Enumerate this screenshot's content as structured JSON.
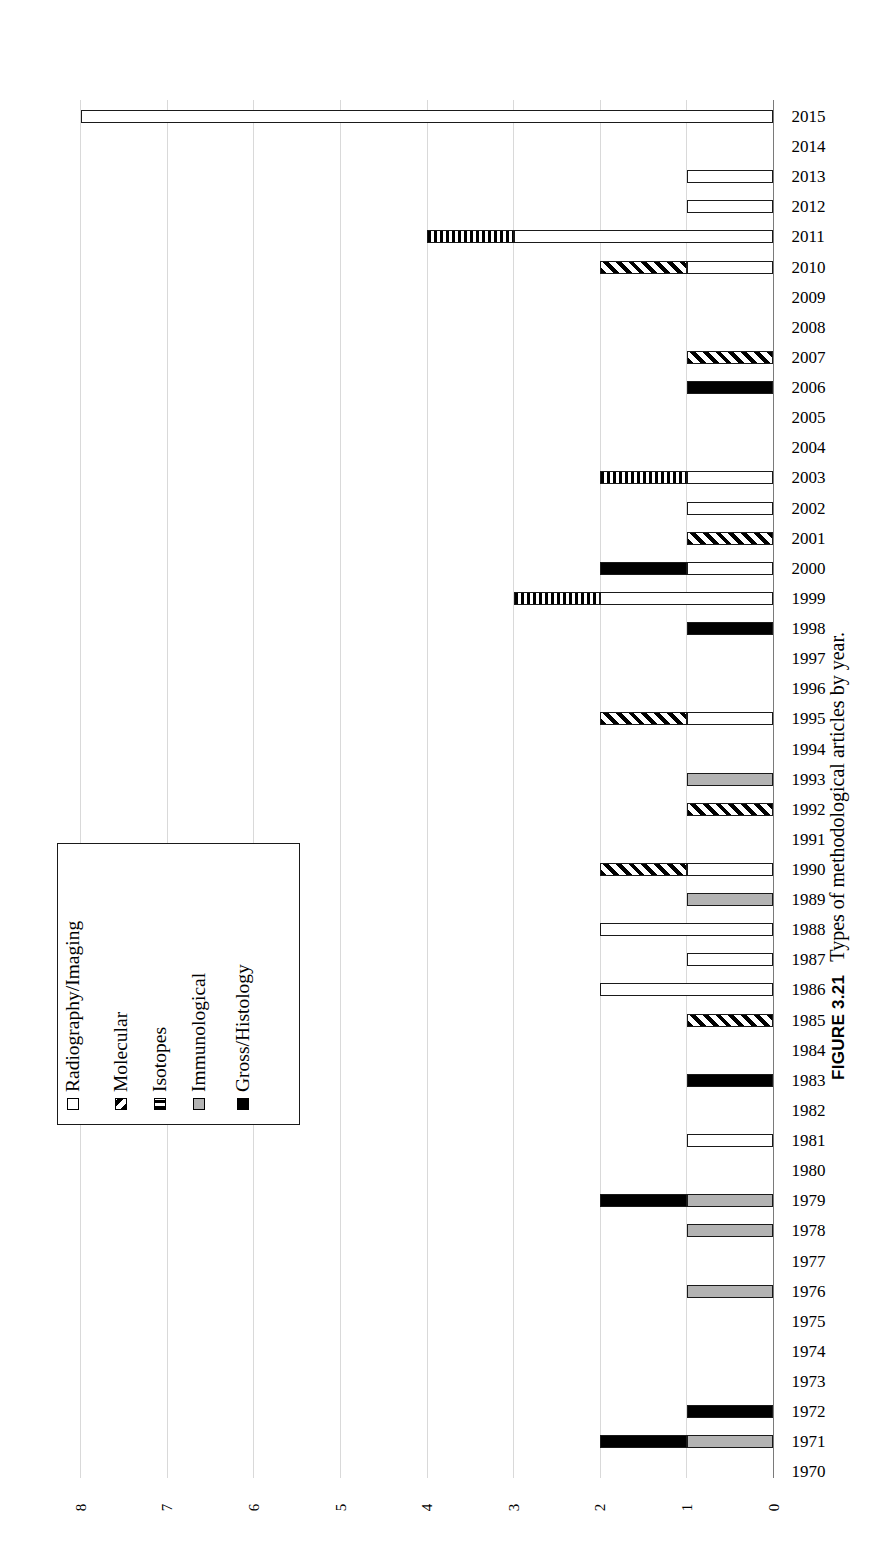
{
  "figure": {
    "number": "FIGURE 3.21",
    "caption": "Types of methodological articles by year."
  },
  "legend": {
    "items": [
      {
        "label": "Radiography/Imaging",
        "key": "radiography",
        "color": "#ffffff",
        "pattern": "solid-white"
      },
      {
        "label": "Molecular",
        "key": "molecular",
        "color": "#000000",
        "pattern": "diagonal-hatch"
      },
      {
        "label": "Isotopes",
        "key": "isotopes",
        "color": "#000000",
        "pattern": "vertical-stripes"
      },
      {
        "label": "Immunological",
        "key": "immuno",
        "color": "#b3b3b3",
        "pattern": "solid-gray"
      },
      {
        "label": "Gross/Histology",
        "key": "gross",
        "color": "#000000",
        "pattern": "solid-black"
      }
    ]
  },
  "axes": {
    "value_ticks": [
      "8",
      "7",
      "6",
      "5",
      "4",
      "3",
      "2",
      "1",
      "0"
    ],
    "value_max": 8,
    "value_min": 0,
    "grid": true,
    "orientation": "horizontal-bars-rotated"
  },
  "chart_data": {
    "type": "bar",
    "title": "Types of methodological articles by year.",
    "xlabel": "",
    "ylabel": "",
    "ylim": [
      0,
      8
    ],
    "stacked": true,
    "grid": true,
    "legend_position": "inside-left",
    "categories": [
      "2015",
      "2014",
      "2013",
      "2012",
      "2011",
      "2010",
      "2009",
      "2008",
      "2007",
      "2006",
      "2005",
      "2004",
      "2003",
      "2002",
      "2001",
      "2000",
      "1999",
      "1998",
      "1997",
      "1996",
      "1995",
      "1994",
      "1993",
      "1992",
      "1991",
      "1990",
      "1989",
      "1988",
      "1987",
      "1986",
      "1985",
      "1984",
      "1983",
      "1982",
      "1981",
      "1980",
      "1979",
      "1978",
      "1977",
      "1976",
      "1975",
      "1974",
      "1973",
      "1972",
      "1971",
      "1970"
    ],
    "series": [
      {
        "name": "Radiography/Imaging",
        "key": "radiography",
        "values": [
          8,
          0,
          1,
          1,
          3,
          1,
          0,
          0,
          0,
          0,
          0,
          0,
          1,
          1,
          0,
          1,
          2,
          0,
          0,
          0,
          1,
          0,
          0,
          0,
          0,
          1,
          0,
          2,
          1,
          2,
          0,
          0,
          0,
          0,
          1,
          0,
          0,
          0,
          0,
          0,
          0,
          0,
          0,
          0,
          0,
          0
        ]
      },
      {
        "name": "Molecular",
        "key": "molecular",
        "values": [
          0,
          0,
          0,
          0,
          0,
          1,
          0,
          0,
          1,
          0,
          0,
          0,
          0,
          0,
          1,
          0,
          0,
          0,
          0,
          0,
          1,
          0,
          0,
          1,
          0,
          1,
          0,
          0,
          0,
          0,
          1,
          0,
          0,
          0,
          0,
          0,
          0,
          0,
          0,
          0,
          0,
          0,
          0,
          0,
          0,
          0
        ]
      },
      {
        "name": "Isotopes",
        "key": "isotopes",
        "values": [
          0,
          0,
          0,
          0,
          1,
          0,
          0,
          0,
          0,
          0,
          0,
          0,
          1,
          0,
          0,
          0,
          1,
          0,
          0,
          0,
          0,
          0,
          0,
          0,
          0,
          0,
          0,
          0,
          0,
          0,
          0,
          0,
          0,
          0,
          0,
          0,
          0,
          0,
          0,
          0,
          0,
          0,
          0,
          0,
          0,
          0
        ]
      },
      {
        "name": "Immunological",
        "key": "immuno",
        "values": [
          0,
          0,
          0,
          0,
          0,
          0,
          0,
          0,
          0,
          0,
          0,
          0,
          0,
          0,
          0,
          0,
          0,
          0,
          0,
          0,
          0,
          0,
          1,
          0,
          0,
          0,
          1,
          0,
          0,
          0,
          0,
          0,
          0,
          0,
          0,
          0,
          1,
          1,
          0,
          1,
          0,
          0,
          0,
          0,
          1,
          0
        ]
      },
      {
        "name": "Gross/Histology",
        "key": "gross",
        "values": [
          0,
          0,
          0,
          0,
          0,
          0,
          0,
          0,
          0,
          1,
          0,
          0,
          0,
          0,
          0,
          1,
          0,
          1,
          0,
          0,
          0,
          0,
          0,
          0,
          0,
          0,
          0,
          0,
          0,
          0,
          0,
          0,
          1,
          0,
          0,
          0,
          1,
          0,
          0,
          0,
          0,
          0,
          0,
          1,
          1,
          0
        ]
      }
    ],
    "totals": [
      8,
      0,
      1,
      1,
      4,
      2,
      0,
      0,
      1,
      1,
      0,
      0,
      2,
      1,
      1,
      2,
      3,
      1,
      0,
      0,
      2,
      0,
      1,
      1,
      0,
      2,
      1,
      2,
      1,
      2,
      1,
      0,
      1,
      0,
      1,
      0,
      2,
      1,
      0,
      1,
      0,
      0,
      0,
      1,
      2,
      0
    ],
    "stack_order_from_axis": [
      "radiography",
      "immuno",
      "gross",
      "molecular",
      "isotopes"
    ]
  }
}
